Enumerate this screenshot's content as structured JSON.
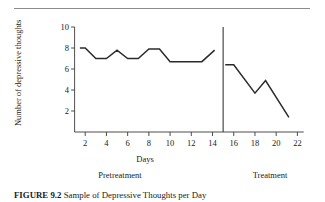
{
  "figure": {
    "caption_label": "FIGURE 9.2",
    "caption_body": "Sample of Depressive Thoughts per Day"
  },
  "chart_data": {
    "type": "line",
    "title": "",
    "xlabel": "Days",
    "ylabel": "Number of depressive thoughts",
    "xlim": [
      0,
      23
    ],
    "ylim": [
      0,
      10
    ],
    "grid": false,
    "legend_position": "none",
    "x_ticks": [
      2,
      4,
      6,
      8,
      10,
      12,
      14,
      16,
      18,
      20,
      22
    ],
    "y_ticks": [
      2,
      4,
      6,
      8,
      10
    ],
    "phase_divider_x": 15,
    "phases": [
      {
        "name": "Pretreatment",
        "label": "Pretreatment",
        "x_range": [
          1.5,
          14.2
        ]
      },
      {
        "name": "Treatment",
        "label": "Treatment",
        "x_range": [
          15.2,
          21.2
        ]
      }
    ],
    "series": [
      {
        "name": "Pretreatment",
        "x": [
          1.5,
          2.0,
          3.0,
          4.0,
          5.0,
          6.0,
          7.0,
          8.0,
          9.0,
          10.0,
          13.0,
          14.2
        ],
        "values": [
          8.0,
          8.0,
          7.0,
          7.0,
          7.8,
          7.0,
          7.0,
          7.9,
          7.9,
          6.7,
          6.7,
          7.8
        ]
      },
      {
        "name": "Treatment",
        "x": [
          15.2,
          16.0,
          18.0,
          19.0,
          21.2
        ],
        "values": [
          6.4,
          6.4,
          3.7,
          4.9,
          1.4
        ]
      }
    ]
  }
}
